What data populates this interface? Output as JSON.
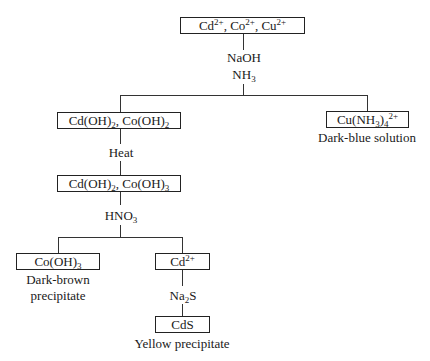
{
  "diagram": {
    "nodes": {
      "start": {
        "parts": [
          [
            "Cd",
            ""
          ],
          [
            "2+",
            "sup"
          ],
          [
            ", Co",
            ""
          ],
          [
            "2+",
            "sup"
          ],
          [
            ", Cu",
            ""
          ],
          [
            "2+",
            "sup"
          ]
        ]
      },
      "hydroxides1": {
        "parts": [
          [
            "Cd(OH)",
            ""
          ],
          [
            "2",
            "sub"
          ],
          [
            ", Co(OH)",
            ""
          ],
          [
            "2",
            "sub"
          ]
        ]
      },
      "copper_complex": {
        "parts": [
          [
            "Cu(NH",
            ""
          ],
          [
            "3",
            "sub"
          ],
          [
            ")",
            ""
          ],
          [
            "4",
            "sub"
          ],
          [
            "2+",
            "sup"
          ]
        ],
        "caption": "Dark-blue solution"
      },
      "hydroxides2": {
        "parts": [
          [
            "Cd(OH)",
            ""
          ],
          [
            "2",
            "sub"
          ],
          [
            ", Co(OH)",
            ""
          ],
          [
            "3",
            "sub"
          ]
        ]
      },
      "cobalt_hydroxide": {
        "parts": [
          [
            "Co(OH)",
            ""
          ],
          [
            "3",
            "sub"
          ]
        ],
        "caption_line1": "Dark-brown",
        "caption_line2": "precipitate"
      },
      "cadmium_ion": {
        "parts": [
          [
            "Cd",
            ""
          ],
          [
            "2+",
            "sup"
          ]
        ]
      },
      "cadmium_sulfide": {
        "parts": [
          [
            "CdS",
            ""
          ]
        ],
        "caption": "Yellow precipitate"
      }
    },
    "reagents": {
      "step1_line1": "NaOH",
      "step1_line2": {
        "parts": [
          [
            "NH",
            ""
          ],
          [
            "3",
            "sub"
          ]
        ]
      },
      "step2": "Heat",
      "step3": {
        "parts": [
          [
            "HNO",
            ""
          ],
          [
            "3",
            "sub"
          ]
        ]
      },
      "step4": {
        "parts": [
          [
            "Na",
            ""
          ],
          [
            "2",
            "sub"
          ],
          [
            "S",
            ""
          ]
        ]
      }
    }
  }
}
